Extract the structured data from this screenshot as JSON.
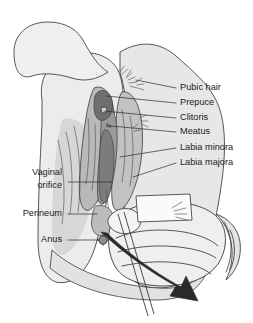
{
  "figure": {
    "background_color": "#ffffff",
    "width": 253,
    "height": 323,
    "style": "grayscale medical line drawing"
  },
  "palette": {
    "background": "#ffffff",
    "skin_light": "#ececed",
    "skin_mid": "#dcdcdd",
    "skin_shade": "#c9c9ca",
    "tissue_mid": "#b4b4b5",
    "tissue_dark": "#8f8f90",
    "tissue_darkest": "#6a6a6b",
    "line": "#3a3a3a",
    "label_text": "#1c1c1c",
    "arrow_fill": "#2a2a2a"
  },
  "labels": {
    "right": [
      {
        "id": "pubic-hair",
        "text": "Pubic hair",
        "x": 180,
        "y": 88,
        "leader_from_x": 170,
        "leader_to_x": 132,
        "leader_to_y": 80
      },
      {
        "id": "prepuce",
        "text": "Prepuce",
        "x": 180,
        "y": 103,
        "leader_from_x": 170,
        "leader_to_x": 104,
        "leader_to_y": 95
      },
      {
        "id": "clitoris",
        "text": "Clitoris",
        "x": 180,
        "y": 118,
        "leader_from_x": 170,
        "leader_to_x": 103,
        "leader_to_y": 111
      },
      {
        "id": "meatus",
        "text": "Meatus",
        "x": 180,
        "y": 132,
        "leader_from_x": 170,
        "leader_to_x": 111,
        "leader_to_y": 126
      },
      {
        "id": "labia-minora",
        "text": "Labia minora",
        "x": 180,
        "y": 148,
        "leader_from_x": 170,
        "leader_to_x": 118,
        "leader_to_y": 156
      },
      {
        "id": "labia-majora",
        "text": "Labia majora",
        "x": 180,
        "y": 163,
        "leader_from_x": 170,
        "leader_to_x": 131,
        "leader_to_y": 176
      }
    ],
    "left": [
      {
        "id": "vaginal-orifice-line1",
        "text": "Vaginal",
        "x": 62,
        "y": 173
      },
      {
        "id": "vaginal-orifice-line2",
        "text": "orifice",
        "x": 62,
        "y": 186
      },
      {
        "id": "perineum",
        "text": "Perineum",
        "x": 62,
        "y": 214
      },
      {
        "id": "anus",
        "text": "Anus",
        "x": 62,
        "y": 240
      }
    ],
    "left_leaders": [
      {
        "id": "vaginal-orifice-leader",
        "x1": 68,
        "y1": 182,
        "x2": 112,
        "y2": 182
      },
      {
        "id": "perineum-leader",
        "x1": 68,
        "y1": 214,
        "x2": 97,
        "y2": 214
      },
      {
        "id": "anus-leader",
        "x1": 68,
        "y1": 240,
        "x2": 100,
        "y2": 240
      }
    ]
  },
  "annotations": {
    "direction_arrow": {
      "id": "downward-stroke-arrow",
      "description": "large solid arrow indicating downward wiping direction",
      "from": [
        103,
        235
      ],
      "to": [
        196,
        300
      ],
      "fill": "#2a2a2a"
    },
    "applicator": {
      "id": "applicator-stick",
      "description": "swab stick held in the gloved hand, angled down-left"
    }
  },
  "structures": [
    {
      "id": "upper-thigh-left",
      "name": "left thigh"
    },
    {
      "id": "upper-thigh-right",
      "name": "right thigh"
    },
    {
      "id": "labia-majora-body",
      "name": "labia majora"
    },
    {
      "id": "labia-minora-body",
      "name": "labia minora"
    },
    {
      "id": "vestibule",
      "name": "vestibule"
    },
    {
      "id": "perineal-body",
      "name": "perineum"
    },
    {
      "id": "anus-marker",
      "name": "anus"
    },
    {
      "id": "hand",
      "name": "gloved hand"
    },
    {
      "id": "wrist-cuff",
      "name": "wrist cuff"
    }
  ]
}
